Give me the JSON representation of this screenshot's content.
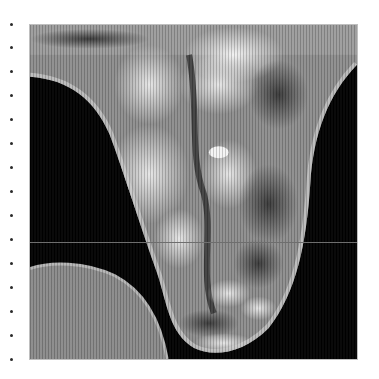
{
  "image": {
    "description": "Grayscale medical scan-style image with vertical scanline texture inside a bordered frame",
    "frame": {
      "left": 29,
      "top": 24,
      "width": 329,
      "height": 336
    },
    "background_color": "#000000",
    "border_color": "#bfbfbf",
    "horizontal_line_y": 217,
    "horizontal_line_color": "#6e6e6e"
  },
  "left_dots": {
    "x": 11,
    "positions_y": [
      23,
      46,
      70,
      94,
      118,
      142,
      166,
      190,
      214,
      238,
      262,
      286,
      310,
      334,
      358
    ]
  },
  "colors": {
    "tissue_light": "#d8d8d8",
    "tissue_mid": "#9a9a9a",
    "tissue_dark": "#4a4a4a",
    "disc": "#8c8c8c"
  }
}
